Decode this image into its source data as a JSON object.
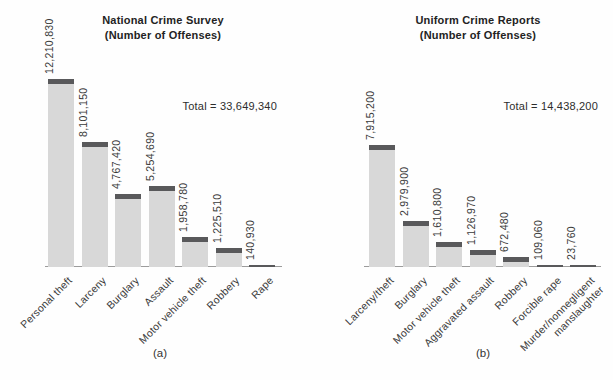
{
  "colors": {
    "bar_fill": "#d8d8d8",
    "bar_cap": "#59595b",
    "axis": "#9c9c9c",
    "text": "#3a3a3a"
  },
  "chart_data": [
    {
      "type": "bar",
      "title": "National Crime Survey",
      "subtitle": "(Number of Offenses)",
      "total_label": "Total = 33,649,340",
      "total": 33649340,
      "caption": "(a)",
      "categories": [
        "Personal theft",
        "Larceny",
        "Burglary",
        "Assault",
        "Motor vehicle theft",
        "Robbery",
        "Rape"
      ],
      "values": [
        12210830,
        8101150,
        4767420,
        5254690,
        1958780,
        1225510,
        140930
      ],
      "value_labels": [
        "12,210,830",
        "8,101,150",
        "4,767,420",
        "5,254,690",
        "1,958,780",
        "1,225,510",
        "140,930"
      ],
      "ylabel": "",
      "xlabel": "",
      "grid": false,
      "legend": false
    },
    {
      "type": "bar",
      "title": "Uniform Crime Reports",
      "subtitle": "(Number of Offenses)",
      "total_label": "Total = 14,438,200",
      "total": 14438200,
      "caption": "(b)",
      "categories": [
        "Larceny/theft",
        "Burglary",
        "Motor vehicle theft",
        "Aggravated assault",
        "Robbery",
        "Forcible rape",
        "Murder/nonnegligent\nmanslaughter"
      ],
      "values": [
        7915200,
        2979900,
        1610800,
        1126970,
        672480,
        109060,
        23760
      ],
      "value_labels": [
        "7,915,200",
        "2,979,900",
        "1,610,800",
        "1,126,970",
        "672,480",
        "109,060",
        "23,760"
      ],
      "ylabel": "",
      "xlabel": "",
      "grid": false,
      "legend": false
    }
  ]
}
